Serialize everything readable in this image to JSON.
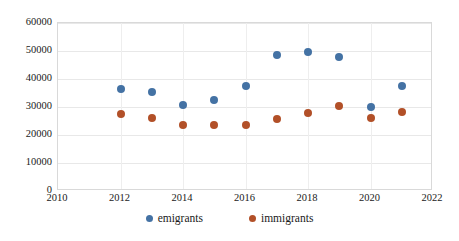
{
  "chart_data": {
    "type": "scatter",
    "title": "",
    "subtitle": "",
    "xlabel": "",
    "ylabel": "",
    "x": [
      2012,
      2013,
      2014,
      2015,
      2016,
      2017,
      2018,
      2019,
      2020,
      2021
    ],
    "xlim": [
      2010,
      2022
    ],
    "ylim": [
      0,
      60000
    ],
    "xticks": [
      "2010",
      "2012",
      "2014",
      "2016",
      "2018",
      "2020",
      "2022"
    ],
    "xtick_values": [
      2010,
      2012,
      2014,
      2016,
      2018,
      2020,
      2022
    ],
    "yticks": [
      "0",
      "10000",
      "20000",
      "30000",
      "40000",
      "50000",
      "60000"
    ],
    "ytick_values": [
      0,
      10000,
      20000,
      30000,
      40000,
      50000,
      60000
    ],
    "grid": true,
    "grid_axis": "both",
    "legend_position": "bottom",
    "series": [
      {
        "name": "emigrants",
        "color": "#4472A4",
        "marker": "circle",
        "values": [
          36500,
          35200,
          30800,
          32400,
          37500,
          48400,
          49500,
          47700,
          30000,
          37600
        ]
      },
      {
        "name": "immigrants",
        "color": "#B25028",
        "marker": "circle",
        "values": [
          27500,
          26000,
          23400,
          23600,
          23600,
          25700,
          28000,
          30200,
          25900,
          28200
        ]
      }
    ],
    "colors": {
      "emigrants": "#4472A4",
      "immigrants": "#B25028",
      "gridline": "#E8E8E8",
      "plot_border": "#D9D9D9",
      "text": "#1A1A1A",
      "background": "#FFFFFF"
    },
    "legend": [
      {
        "label": "emigrants",
        "color": "#4472A4"
      },
      {
        "label": "immigrants",
        "color": "#B25028"
      }
    ]
  }
}
